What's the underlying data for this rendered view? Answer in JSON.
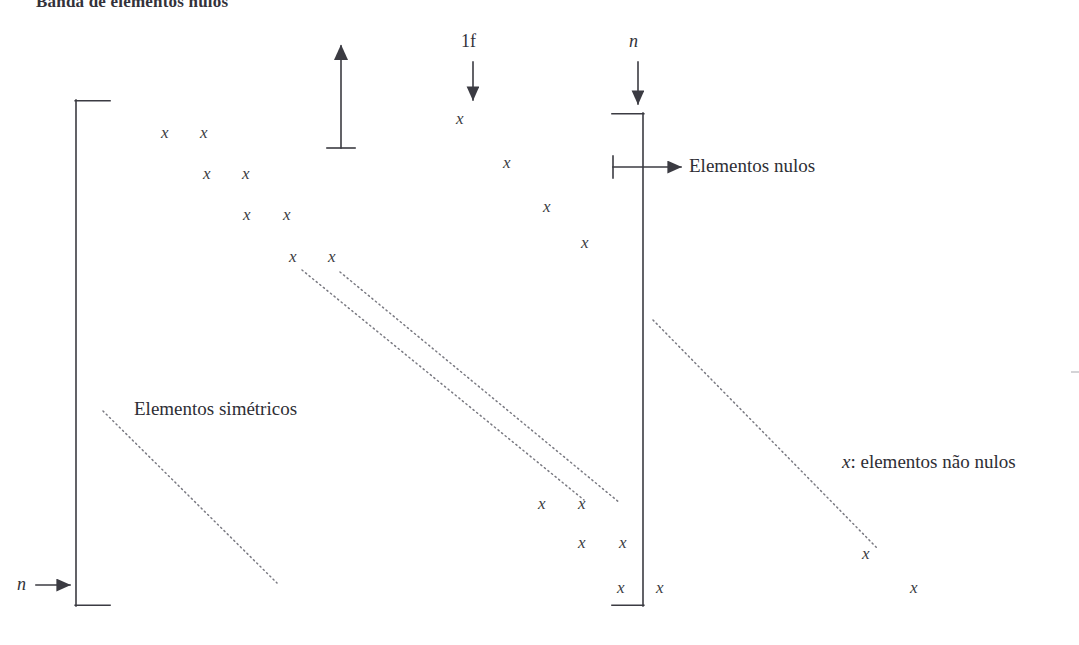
{
  "figure": {
    "caption_top": "Banda de elementos nulos",
    "width": 1079,
    "height": 645,
    "ink_color": "#3b3b42",
    "dotted_color": "#7a7a82"
  },
  "labels": {
    "one_f": "1f",
    "n_top": "n",
    "n_left": "n",
    "elementos_nulos": "Elementos nulos",
    "elementos_simetricos": "Elementos simétricos",
    "legend_nonzero_prefix": "x",
    "legend_nonzero_rest": ": elementos não nulos"
  },
  "x_marks": {
    "glyph": "x",
    "positions": [
      {
        "x": 166,
        "y": 133,
        "group": "upper-band"
      },
      {
        "x": 205,
        "y": 133,
        "group": "upper-band"
      },
      {
        "x": 208,
        "y": 174,
        "group": "upper-band"
      },
      {
        "x": 247,
        "y": 174,
        "group": "upper-band"
      },
      {
        "x": 248,
        "y": 215,
        "group": "upper-band"
      },
      {
        "x": 288,
        "y": 215,
        "group": "upper-band"
      },
      {
        "x": 294,
        "y": 257,
        "group": "upper-band"
      },
      {
        "x": 333,
        "y": 257,
        "group": "upper-band"
      },
      {
        "x": 461,
        "y": 119,
        "group": "diagonal-fill"
      },
      {
        "x": 508,
        "y": 163,
        "group": "diagonal-fill"
      },
      {
        "x": 548,
        "y": 207,
        "group": "diagonal-fill"
      },
      {
        "x": 586,
        "y": 243,
        "group": "diagonal-fill"
      },
      {
        "x": 543,
        "y": 504,
        "group": "lower-band"
      },
      {
        "x": 583,
        "y": 504,
        "group": "lower-band"
      },
      {
        "x": 583,
        "y": 543,
        "group": "lower-band"
      },
      {
        "x": 624,
        "y": 543,
        "group": "lower-band"
      },
      {
        "x": 622,
        "y": 588,
        "group": "lower-band"
      },
      {
        "x": 661,
        "y": 588,
        "group": "lower-band"
      },
      {
        "x": 867,
        "y": 554,
        "group": "outer-right"
      },
      {
        "x": 915,
        "y": 588,
        "group": "outer-right"
      }
    ]
  },
  "geometry": {
    "left_bracket": {
      "x": 76,
      "y_top": 100,
      "y_bottom": 606,
      "arm": 34
    },
    "right_bracket": {
      "x": 643,
      "y_top": 113,
      "y_bottom": 606,
      "arm": 31
    },
    "up_arrow": {
      "x": 341,
      "y_tip": 42,
      "y_base": 148,
      "base_half_width": 14
    },
    "arrow_1f": {
      "x": 473,
      "y_from": 62,
      "y_to": 100
    },
    "arrow_n": {
      "x": 638,
      "y_from": 62,
      "y_to": 106
    },
    "arrow_nulos": {
      "y": 167,
      "x_tick": 613,
      "x_from": 613,
      "x_to": 681
    },
    "arrow_n_left": {
      "y": 585,
      "x_from": 36,
      "x_to": 70
    },
    "dotted_band_upper": {
      "x1": 302,
      "y1": 270,
      "x2": 584,
      "y2": 500
    },
    "dotted_band_lower": {
      "x1": 340,
      "y1": 272,
      "x2": 620,
      "y2": 503
    },
    "dotted_symmetric": {
      "x1": 103,
      "y1": 411,
      "x2": 277,
      "y2": 583
    },
    "dotted_right": {
      "x1": 653,
      "y1": 320,
      "x2": 877,
      "y2": 548
    }
  }
}
